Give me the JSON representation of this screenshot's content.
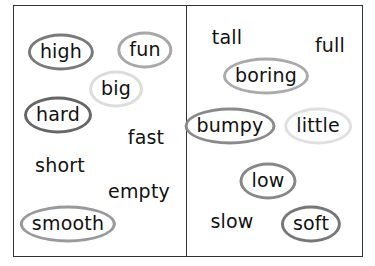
{
  "left_panel": {
    "words": [
      {
        "text": "high",
        "x": 61,
        "y": 52,
        "circled": true,
        "circle_color": "#7a7a7a"
      },
      {
        "text": "fun",
        "x": 145,
        "y": 50,
        "circled": true,
        "circle_color": "#a8a8a8"
      },
      {
        "text": "big",
        "x": 116,
        "y": 89,
        "circled": true,
        "circle_color": "#dcdcdc"
      },
      {
        "text": "hard",
        "x": 58,
        "y": 115,
        "circled": true,
        "circle_color": "#666666"
      },
      {
        "text": "fast",
        "x": 146,
        "y": 137,
        "circled": false
      },
      {
        "text": "short",
        "x": 60,
        "y": 165,
        "circled": false
      },
      {
        "text": "empty",
        "x": 139,
        "y": 191,
        "circled": false
      },
      {
        "text": "smooth",
        "x": 68,
        "y": 224,
        "circled": true,
        "circle_color": "#999999"
      }
    ]
  },
  "right_panel": {
    "words": [
      {
        "text": "tall",
        "x": 227,
        "y": 37,
        "circled": false
      },
      {
        "text": "full",
        "x": 330,
        "y": 45,
        "circled": false
      },
      {
        "text": "boring",
        "x": 266,
        "y": 76,
        "circled": true,
        "circle_color": "#aaaaaa"
      },
      {
        "text": "bumpy",
        "x": 230,
        "y": 126,
        "circled": true,
        "circle_color": "#8a8a8a"
      },
      {
        "text": "little",
        "x": 318,
        "y": 126,
        "circled": true,
        "circle_color": "#e0e0e0"
      },
      {
        "text": "low",
        "x": 268,
        "y": 181,
        "circled": true,
        "circle_color": "#888888"
      },
      {
        "text": "slow",
        "x": 232,
        "y": 221,
        "circled": false
      },
      {
        "text": "soft",
        "x": 311,
        "y": 224,
        "circled": true,
        "circle_color": "#777777"
      }
    ]
  }
}
